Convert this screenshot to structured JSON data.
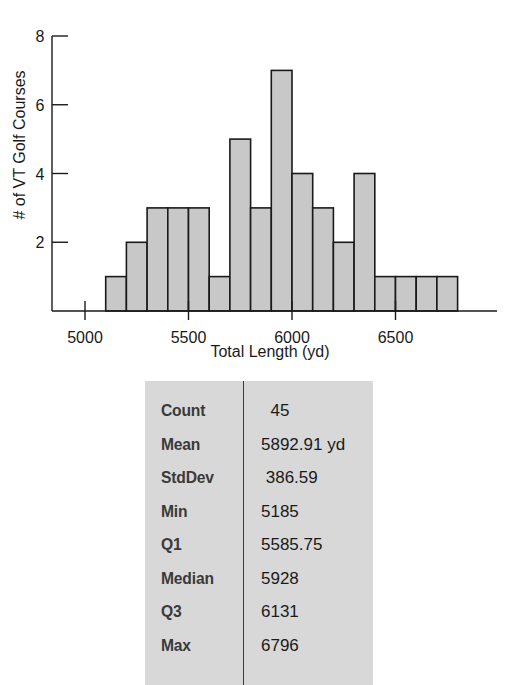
{
  "chart_data": {
    "type": "bar",
    "title": "",
    "xlabel": "Total Length (yd)",
    "ylabel": "# of VT Golf Courses",
    "bin_width": 100,
    "bin_edges": [
      5100,
      5200,
      5300,
      5400,
      5500,
      5600,
      5700,
      5800,
      5900,
      6000,
      6100,
      6200,
      6300,
      6400,
      6500,
      6600,
      6700,
      6800
    ],
    "categories": [
      "5100-5200",
      "5200-5300",
      "5300-5400",
      "5400-5500",
      "5500-5600",
      "5600-5700",
      "5700-5800",
      "5800-5900",
      "5900-6000",
      "6000-6100",
      "6100-6200",
      "6200-6300",
      "6300-6400",
      "6400-6500",
      "6500-6600",
      "6600-6700",
      "6700-6800"
    ],
    "values": [
      1,
      2,
      3,
      3,
      3,
      1,
      5,
      3,
      7,
      4,
      3,
      2,
      4,
      1,
      1,
      1,
      1
    ],
    "xlim": [
      4990,
      6990
    ],
    "ylim": [
      0,
      8
    ],
    "x_ticks": [
      5000,
      5500,
      6000,
      6500
    ],
    "y_ticks": [
      2,
      4,
      6,
      8
    ],
    "grid": false,
    "legend": null,
    "bar_color": "#c8c8c8",
    "bar_edge_color": "#1a1a1a"
  },
  "stats": {
    "rows": [
      {
        "label": "Count",
        "value": "  45"
      },
      {
        "label": "Mean",
        "value": "5892.91 yd"
      },
      {
        "label": "StdDev",
        "value": " 386.59"
      },
      {
        "label": "Min",
        "value": "5185"
      },
      {
        "label": "Q1",
        "value": "5585.75"
      },
      {
        "label": "Median",
        "value": "5928"
      },
      {
        "label": "Q3",
        "value": "6131"
      },
      {
        "label": "Max",
        "value": "6796"
      }
    ]
  }
}
